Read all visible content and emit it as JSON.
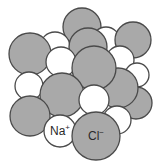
{
  "diagram": {
    "colors": {
      "chloride": "#a9a9a9",
      "sodium": "#ffffff",
      "outline": "#4a4a4a",
      "background": "#ffffff"
    },
    "labels": {
      "sodium": {
        "base": "Na",
        "charge": "+"
      },
      "chloride": {
        "base": "Cl",
        "charge": "−"
      }
    },
    "ions": [
      {
        "type": "chloride",
        "cx": 82,
        "cy": 27,
        "r": 19
      },
      {
        "type": "sodium",
        "cx": 55,
        "cy": 47,
        "r": 15
      },
      {
        "type": "sodium",
        "cx": 106,
        "cy": 41,
        "r": 14
      },
      {
        "type": "chloride",
        "cx": 133,
        "cy": 40,
        "r": 18
      },
      {
        "type": "chloride",
        "cx": 88,
        "cy": 47,
        "r": 19
      },
      {
        "type": "sodium",
        "cx": 120,
        "cy": 60,
        "r": 14
      },
      {
        "type": "chloride",
        "cx": 30,
        "cy": 54,
        "r": 21
      },
      {
        "type": "sodium",
        "cx": 137,
        "cy": 75,
        "r": 12
      },
      {
        "type": "sodium",
        "cx": 61,
        "cy": 62,
        "r": 15
      },
      {
        "type": "sodium",
        "cx": 29,
        "cy": 86,
        "r": 14
      },
      {
        "type": "chloride",
        "cx": 136,
        "cy": 103,
        "r": 16
      },
      {
        "type": "chloride",
        "cx": 118,
        "cy": 88,
        "r": 20
      },
      {
        "type": "chloride",
        "cx": 94,
        "cy": 68,
        "r": 22
      },
      {
        "type": "chloride",
        "cx": 62,
        "cy": 95,
        "r": 22
      },
      {
        "type": "sodium",
        "cx": 117,
        "cy": 120,
        "r": 14
      },
      {
        "type": "chloride",
        "cx": 30,
        "cy": 116,
        "r": 20
      },
      {
        "type": "sodium",
        "cx": 94,
        "cy": 100,
        "r": 15
      },
      {
        "type": "sodium",
        "cx": 60,
        "cy": 131,
        "r": 16,
        "label": "sodium"
      },
      {
        "type": "chloride",
        "cx": 96,
        "cy": 136,
        "r": 24,
        "label": "chloride"
      }
    ]
  }
}
